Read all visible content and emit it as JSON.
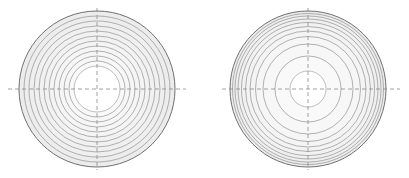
{
  "page": {
    "background": "#ffffff",
    "width": 409,
    "height": 178,
    "caption_fragment": "."
  },
  "style": {
    "ring_stroke": "#8a8a8a",
    "rim_stroke": "#6f6f6f",
    "inner_stroke": "#9a9a9a",
    "crosshair_color": "#8c8c8c",
    "fill_light": "#f4f4f4",
    "fill_mid": "#efefef",
    "hole_fill": "#ffffff"
  },
  "figures": [
    {
      "id": "left-figure",
      "name": "uniform-concentric-rings",
      "center_x": 97,
      "center_y": 89,
      "outer_radius": 78,
      "inner_hole_radius": 23,
      "ring_count": 12,
      "spacing": "uniform",
      "ring_radii": [
        78,
        73,
        68,
        63,
        58,
        53,
        48,
        43,
        38,
        33,
        28,
        23
      ],
      "crosshair": {
        "h_x1": 8,
        "h_x2": 186,
        "h_y": 89,
        "v_y1": 8,
        "v_y2": 170,
        "v_x": 97,
        "dash": "4 3"
      }
    },
    {
      "id": "right-figure",
      "name": "compressed-outer-rings",
      "center_x": 308,
      "center_y": 89,
      "outer_radius": 78,
      "inner_hole_radius": 18,
      "ring_count": 11,
      "spacing": "non-uniform-outer-compressed",
      "ring_radii": [
        78,
        75.5,
        73,
        70,
        66.5,
        62.5,
        58,
        52.5,
        45,
        33,
        18
      ],
      "crosshair": {
        "h_x1": 222,
        "h_x2": 400,
        "h_y": 89,
        "v_y1": 8,
        "v_y2": 170,
        "v_x": 308,
        "dash": "4 3"
      }
    }
  ]
}
